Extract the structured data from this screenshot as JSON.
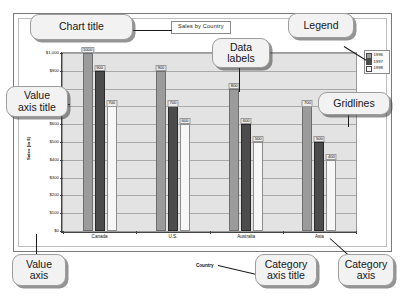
{
  "chart_data": {
    "type": "bar",
    "title": "Sales by Country",
    "xlabel": "Country",
    "ylabel": "Sales (in $)",
    "categories": [
      "Canada",
      "U.S.",
      "Australia",
      "Asia"
    ],
    "series": [
      {
        "name": "1996",
        "values": [
          1000,
          900,
          800,
          700
        ]
      },
      {
        "name": "1997",
        "values": [
          900,
          700,
          600,
          500
        ]
      },
      {
        "name": "1998",
        "values": [
          700,
          600,
          500,
          400
        ]
      }
    ],
    "ylim": [
      0,
      1000
    ],
    "yticks": [
      0,
      100,
      200,
      300,
      400,
      500,
      600,
      700,
      800,
      900,
      1000
    ],
    "ytick_labels": [
      "$0",
      "$100",
      "$200",
      "$300",
      "$400",
      "$500",
      "$600",
      "$700",
      "$800",
      "$900",
      "$1,000"
    ],
    "grid": true,
    "legend_position": "right",
    "data_labels": true,
    "colors": {
      "series_1996": "#9b9b9b",
      "series_1997": "#4c4c4c",
      "series_1998": "#f7f7f7",
      "plot_background": "#e3e3e3",
      "gridline": "#a9a9a9",
      "axis": "#444444"
    }
  },
  "callouts": {
    "chart_title": "Chart title",
    "legend": "Legend",
    "data_labels": "Data\nlabels",
    "data_labels_line1": "Data",
    "data_labels_line2": "labels",
    "gridlines": "Gridlines",
    "value_axis_title_line1": "Value",
    "value_axis_title_line2": "axis title",
    "value_axis_line1": "Value",
    "value_axis_line2": "axis",
    "category_axis_title_line1": "Category",
    "category_axis_title_line2": "axis title",
    "category_axis_line1": "Category",
    "category_axis_line2": "axis"
  }
}
